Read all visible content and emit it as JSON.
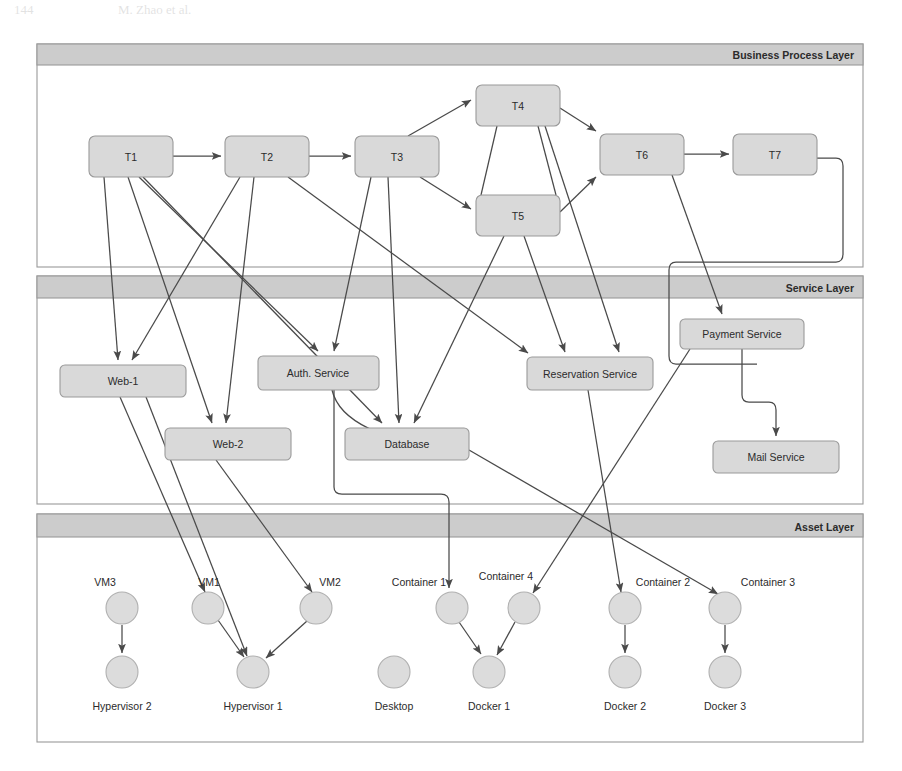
{
  "page_header": {
    "page_number": "144",
    "authors": "M. Zhao et al."
  },
  "figure": {
    "layers": [
      {
        "id": "business",
        "label": "Business Process Layer"
      },
      {
        "id": "service",
        "label": "Service Layer"
      },
      {
        "id": "asset",
        "label": "Asset Layer"
      }
    ],
    "colors": {
      "node_fill": "#d9d9d9",
      "node_stroke": "#9a9a9a",
      "layer_band_fill": "#cccccc",
      "layer_stroke": "#9a9a9a",
      "edge_stroke": "#4a4a4a",
      "circle_fill": "#dcdcdc",
      "circle_stroke": "#b0b0b0",
      "label_text": "#2b2b2b",
      "background": "#ffffff"
    },
    "business_tasks": [
      {
        "id": "T1",
        "label": "T1",
        "x": 89,
        "y": 136,
        "w": 84,
        "h": 41
      },
      {
        "id": "T2",
        "label": "T2",
        "x": 225,
        "y": 136,
        "w": 84,
        "h": 41
      },
      {
        "id": "T3",
        "label": "T3",
        "x": 355,
        "y": 136,
        "w": 84,
        "h": 41
      },
      {
        "id": "T4",
        "label": "T4",
        "x": 476,
        "y": 85,
        "w": 84,
        "h": 41
      },
      {
        "id": "T5",
        "label": "T5",
        "x": 476,
        "y": 195,
        "w": 84,
        "h": 41
      },
      {
        "id": "T6",
        "label": "T6",
        "x": 600,
        "y": 134,
        "w": 84,
        "h": 41
      },
      {
        "id": "T7",
        "label": "T7",
        "x": 733,
        "y": 134,
        "w": 84,
        "h": 41
      }
    ],
    "services": [
      {
        "id": "web1",
        "label": "Web-1",
        "x": 60,
        "y": 365,
        "w": 126,
        "h": 32
      },
      {
        "id": "web2",
        "label": "Web-2",
        "x": 165,
        "y": 428,
        "w": 126,
        "h": 32
      },
      {
        "id": "auth",
        "label": "Auth. Service",
        "x": 258,
        "y": 356,
        "w": 121,
        "h": 34
      },
      {
        "id": "db",
        "label": "Database",
        "x": 345,
        "y": 428,
        "w": 124,
        "h": 32
      },
      {
        "id": "resv",
        "label": "Reservation Service",
        "x": 527,
        "y": 357,
        "w": 126,
        "h": 33
      },
      {
        "id": "pay",
        "label": "Payment Service",
        "x": 680,
        "y": 319,
        "w": 124,
        "h": 30
      },
      {
        "id": "mail",
        "label": "Mail Service",
        "x": 713,
        "y": 441,
        "w": 126,
        "h": 32
      }
    ],
    "assets": [
      {
        "id": "vm3",
        "label": "VM3",
        "cx": 122,
        "cy": 608,
        "r": 16,
        "label_pos": "above-left"
      },
      {
        "id": "hyp2",
        "label": "Hypervisor 2",
        "cx": 122,
        "cy": 672,
        "r": 16,
        "label_pos": "below"
      },
      {
        "id": "vm1",
        "label": "VM1",
        "cx": 208,
        "cy": 608,
        "r": 16,
        "label_pos": "above-left"
      },
      {
        "id": "vm2",
        "label": "VM2",
        "cx": 316,
        "cy": 608,
        "r": 16,
        "label_pos": "above-right"
      },
      {
        "id": "hyp1",
        "label": "Hypervisor 1",
        "cx": 253,
        "cy": 672,
        "r": 16,
        "label_pos": "below"
      },
      {
        "id": "desktop",
        "label": "Desktop",
        "cx": 394,
        "cy": 672,
        "r": 16,
        "label_pos": "below"
      },
      {
        "id": "cont1",
        "label": "Container 1",
        "cx": 452,
        "cy": 608,
        "r": 16,
        "label_pos": "above-left"
      },
      {
        "id": "cont4",
        "label": "Container 4",
        "cx": 524,
        "cy": 608,
        "r": 16,
        "label_pos": "above-left"
      },
      {
        "id": "docker1",
        "label": "Docker 1",
        "cx": 489,
        "cy": 672,
        "r": 16,
        "label_pos": "below"
      },
      {
        "id": "cont2",
        "label": "Container 2",
        "cx": 625,
        "cy": 608,
        "r": 16,
        "label_pos": "above-right"
      },
      {
        "id": "docker2",
        "label": "Docker 2",
        "cx": 625,
        "cy": 672,
        "r": 16,
        "label_pos": "below"
      },
      {
        "id": "cont3",
        "label": "Container 3",
        "cx": 725,
        "cy": 608,
        "r": 16,
        "label_pos": "above-right"
      },
      {
        "id": "docker3",
        "label": "Docker 3",
        "cx": 725,
        "cy": 672,
        "r": 16,
        "label_pos": "below"
      }
    ],
    "edges": [
      {
        "from": "T1",
        "to": "T2",
        "kind": "process-flow"
      },
      {
        "from": "T2",
        "to": "T3",
        "kind": "process-flow"
      },
      {
        "from": "T3",
        "to": "T4",
        "kind": "process-flow"
      },
      {
        "from": "T3",
        "to": "T5",
        "kind": "process-flow"
      },
      {
        "from": "T4",
        "to": "T6",
        "kind": "process-flow"
      },
      {
        "from": "T5",
        "to": "T6",
        "kind": "process-flow"
      },
      {
        "from": "T6",
        "to": "T7",
        "kind": "process-flow"
      },
      {
        "from": "T1",
        "to": "web1",
        "kind": "task-service"
      },
      {
        "from": "T1",
        "to": "web2",
        "kind": "task-service"
      },
      {
        "from": "T1",
        "to": "auth",
        "kind": "task-service"
      },
      {
        "from": "T1",
        "to": "db",
        "kind": "task-service"
      },
      {
        "from": "T2",
        "to": "web1",
        "kind": "task-service"
      },
      {
        "from": "T2",
        "to": "web2",
        "kind": "task-service"
      },
      {
        "from": "T2",
        "to": "resv",
        "kind": "task-service"
      },
      {
        "from": "T3",
        "to": "auth",
        "kind": "task-service"
      },
      {
        "from": "T3",
        "to": "db",
        "kind": "task-service"
      },
      {
        "from": "T4",
        "to": "db",
        "kind": "task-service"
      },
      {
        "from": "T4",
        "to": "resv",
        "kind": "task-service"
      },
      {
        "from": "T5",
        "to": "db",
        "kind": "task-service"
      },
      {
        "from": "T5",
        "to": "resv",
        "kind": "task-service"
      },
      {
        "from": "T6",
        "to": "pay",
        "kind": "task-service"
      },
      {
        "from": "T7",
        "to": "pay",
        "kind": "task-service"
      },
      {
        "from": "auth",
        "to": "db",
        "kind": "service-service"
      },
      {
        "from": "pay",
        "to": "mail",
        "kind": "service-service"
      },
      {
        "from": "web1",
        "to": "vm2",
        "kind": "service-asset"
      },
      {
        "from": "web1",
        "to": "hyp1",
        "kind": "service-asset"
      },
      {
        "from": "web2",
        "to": "vm1",
        "kind": "service-asset"
      },
      {
        "from": "db",
        "to": "cont1",
        "kind": "service-asset"
      },
      {
        "from": "resv",
        "to": "cont4",
        "kind": "service-asset"
      },
      {
        "from": "pay",
        "to": "cont2",
        "kind": "service-asset"
      },
      {
        "from": "mail",
        "to": "cont3",
        "kind": "service-asset"
      },
      {
        "from": "vm3",
        "to": "hyp2",
        "kind": "asset-asset"
      },
      {
        "from": "vm1",
        "to": "hyp1",
        "kind": "asset-asset"
      },
      {
        "from": "vm2",
        "to": "hyp1",
        "kind": "asset-asset"
      },
      {
        "from": "cont1",
        "to": "docker1",
        "kind": "asset-asset"
      },
      {
        "from": "cont4",
        "to": "docker1",
        "kind": "asset-asset"
      },
      {
        "from": "cont2",
        "to": "docker2",
        "kind": "asset-asset"
      },
      {
        "from": "cont3",
        "to": "docker3",
        "kind": "asset-asset"
      }
    ]
  }
}
